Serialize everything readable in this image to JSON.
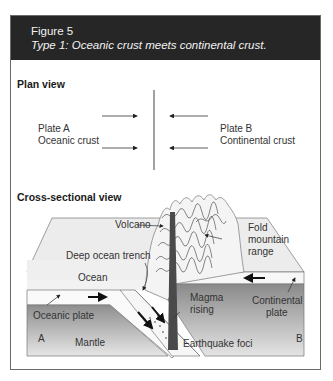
{
  "figure": {
    "number": "Figure 5",
    "title": "Type 1: Oceanic crust meets continental crust."
  },
  "plan_view": {
    "heading": "Plan view",
    "plate_a": {
      "name": "Plate A",
      "type": "Oceanic crust"
    },
    "plate_b": {
      "name": "Plate B",
      "type": "Continental crust"
    }
  },
  "cross_section": {
    "heading": "Cross-sectional view",
    "labels": {
      "volcano": "Volcano",
      "fold_mountain_1": "Fold",
      "fold_mountain_2": "mountain",
      "fold_mountain_3": "range",
      "trench": "Deep ocean trench",
      "ocean": "Ocean",
      "oceanic_plate": "Oceanic plate",
      "magma_1": "Magma",
      "magma_2": "rising",
      "continental_1": "Continental",
      "continental_2": "plate",
      "side_a": "A",
      "side_b": "B",
      "mantle": "Mantle",
      "earthquake": "Earthquake foci"
    }
  },
  "colors": {
    "header_bg": "#262626",
    "header_text": "#f2f2f2",
    "mantle_dark": "#8f8f8f",
    "mantle_light": "#e2e2e2",
    "surface": "#ececec",
    "magma": "#4a4a4a"
  }
}
